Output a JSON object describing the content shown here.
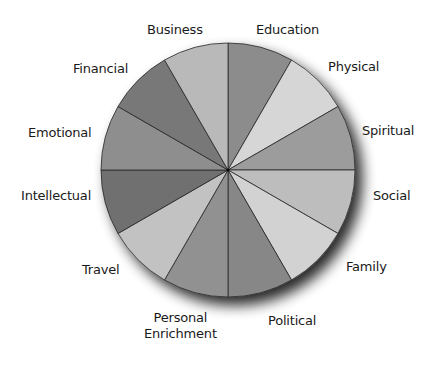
{
  "diagram": {
    "type": "pie",
    "center": [
      228,
      170
    ],
    "radius": 127,
    "stroke_color": "#2a2a2a",
    "shadow_color": "#000000",
    "slices": [
      {
        "label": "Education",
        "start_deg": 0,
        "end_deg": 30,
        "color": "#8c8c8c"
      },
      {
        "label": "Physical",
        "start_deg": 30,
        "end_deg": 60,
        "color": "#d6d6d6"
      },
      {
        "label": "Spiritual",
        "start_deg": 60,
        "end_deg": 90,
        "color": "#9c9c9c"
      },
      {
        "label": "Social",
        "start_deg": 90,
        "end_deg": 120,
        "color": "#bdbdbd"
      },
      {
        "label": "Family",
        "start_deg": 120,
        "end_deg": 150,
        "color": "#d2d2d2"
      },
      {
        "label": "Political",
        "start_deg": 150,
        "end_deg": 180,
        "color": "#878787"
      },
      {
        "label": "Personal Enrichment",
        "start_deg": 180,
        "end_deg": 210,
        "color": "#919191"
      },
      {
        "label": "Travel",
        "start_deg": 210,
        "end_deg": 240,
        "color": "#c2c2c2"
      },
      {
        "label": "Intellectual",
        "start_deg": 240,
        "end_deg": 270,
        "color": "#6f6f6f"
      },
      {
        "label": "Emotional",
        "start_deg": 270,
        "end_deg": 300,
        "color": "#8e8e8e"
      },
      {
        "label": "Financial",
        "start_deg": 300,
        "end_deg": 330,
        "color": "#787878"
      },
      {
        "label": "Business",
        "start_deg": 330,
        "end_deg": 360,
        "color": "#b9b9b9"
      }
    ]
  },
  "labels": {
    "business": {
      "text": "Business",
      "x": 147,
      "y": 22
    },
    "education": {
      "text": "Education",
      "x": 256,
      "y": 22
    },
    "physical": {
      "text": "Physical",
      "x": 328,
      "y": 59
    },
    "spiritual": {
      "text": "Spiritual",
      "x": 362,
      "y": 123
    },
    "social": {
      "text": "Social",
      "x": 373,
      "y": 188
    },
    "family": {
      "text": "Family",
      "x": 346,
      "y": 259
    },
    "political": {
      "text": "Political",
      "x": 268,
      "y": 313
    },
    "personal_enrichment": {
      "line1": "Personal",
      "line2": "Enrichment",
      "x": 144,
      "y": 310
    },
    "travel": {
      "text": "Travel",
      "x": 82,
      "y": 262
    },
    "intellectual": {
      "text": "Intellectual",
      "x": 21,
      "y": 188
    },
    "emotional": {
      "text": "Emotional",
      "x": 28,
      "y": 125
    },
    "financial": {
      "text": "Financial",
      "x": 73,
      "y": 61
    }
  }
}
